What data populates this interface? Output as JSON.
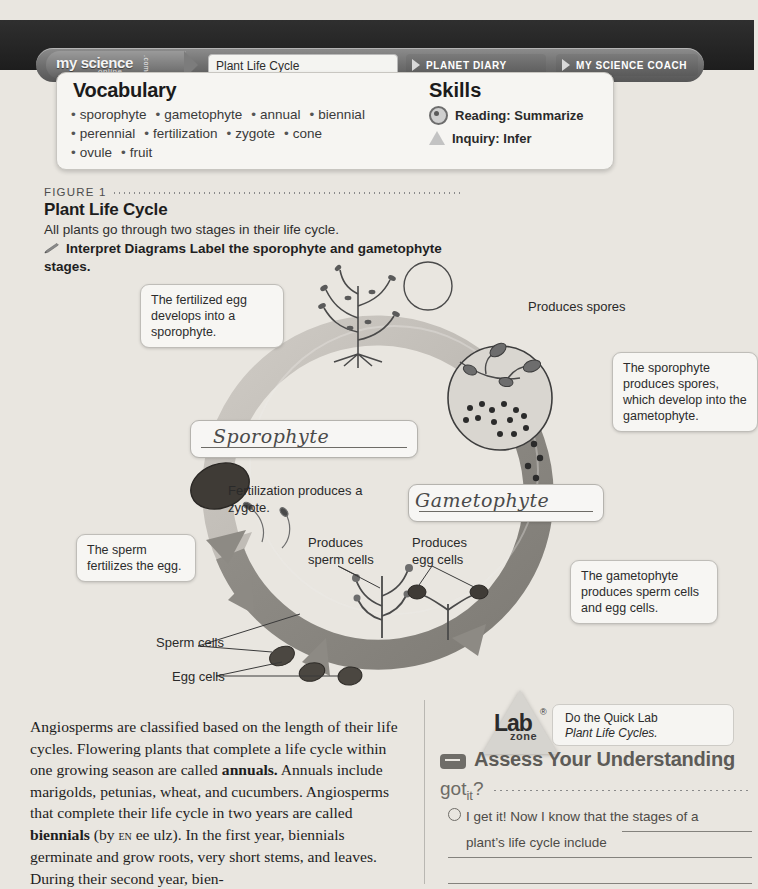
{
  "nav": {
    "brand_line1": "my science",
    "brand_line2": "online",
    "brand_line3": ".com",
    "current_tab": "Plant Life Cycle",
    "tab_planet_diary": "PLANET DIARY",
    "tab_science_coach": "MY SCIENCE COACH"
  },
  "vocabulary": {
    "title": "Vocabulary",
    "row1": [
      "sporophyte",
      "gametophyte",
      "annual",
      "biennial"
    ],
    "row2": [
      "perennial",
      "fertilization",
      "zygote",
      "cone"
    ],
    "row3": [
      "ovule",
      "fruit"
    ]
  },
  "skills": {
    "title": "Skills",
    "items": [
      {
        "icon": "reading-target-icon",
        "label": "Reading: Summarize"
      },
      {
        "icon": "inquiry-triangle-icon",
        "label": "Inquiry: Infer"
      }
    ]
  },
  "figure": {
    "label": "FIGURE 1",
    "title": "Plant Life Cycle",
    "subtitle": "All plants go through two stages in their life cycle.",
    "task_bold": "Interpret Diagrams",
    "task_rest": " Label the sporophyte and gametophyte stages."
  },
  "diagram": {
    "callout_fertilized_egg": "The fertilized egg develops into a sporophyte.",
    "label_produces_spores": "Produces spores",
    "callout_sporophyte_spores": "The sporophyte produces spores, which develop into the gametophyte.",
    "answer_sporophyte": "Sporophyte",
    "answer_gametophyte": "Gametophyte",
    "label_fertilization": "Fertilization produces a zygote.",
    "callout_sperm_fertilizes": "The sperm fertilizes the egg.",
    "label_produces_sperm_cells": "Produces sperm cells",
    "label_produces_egg_cells": "Produces egg cells",
    "callout_gametophyte_cells": "The gametophyte produces sperm cells and egg cells.",
    "label_sperm_cells": "Sperm cells",
    "label_egg_cells": "Egg cells"
  },
  "body": {
    "paragraph_parts": [
      {
        "text": "     Angiosperms are classified based on the length of their life cycles. Flowering plants that complete a life cycle within one growing season are called ",
        "style": "normal"
      },
      {
        "text": "annuals.",
        "style": "bold"
      },
      {
        "text": " Annuals include marigolds, petunias, wheat, and cucumbers. Angiosperms that complete their life cycle in two years are called ",
        "style": "normal"
      },
      {
        "text": "biennials",
        "style": "bold"
      },
      {
        "text": " (by ",
        "style": "normal"
      },
      {
        "text": "en",
        "style": "smallcaps"
      },
      {
        "text": " ee ulz). In the first year, biennials germinate and grow roots, very short stems, and leaves. During their second year, bien-",
        "style": "normal"
      }
    ]
  },
  "lab": {
    "word": "Lab",
    "registered": "®",
    "zone": "zone",
    "line1": "Do the Quick Lab",
    "line2": "Plant Life Cycles."
  },
  "assess": {
    "title": "Assess Your Understanding",
    "got_it_label": "got it?",
    "question_prefix": "I get it!  Now I know that the stages of a",
    "question_line2": "plant’s life cycle include"
  },
  "colors": {
    "page_bg": "#e9e6e0",
    "nav_bar": "#272727",
    "ring_light": "#c0bcb6",
    "ring_dark": "#8d8a84",
    "card_bg": "#f6f5f2",
    "assess_text": "#5d5b57"
  }
}
